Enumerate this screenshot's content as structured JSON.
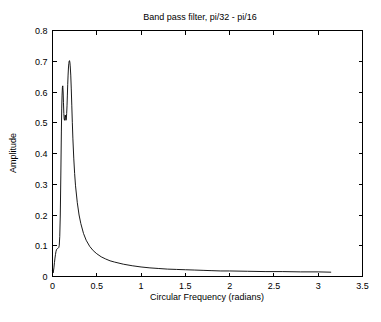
{
  "chart_data": {
    "type": "line",
    "title": "Band pass filter, pi/32 - pi/16",
    "xlabel": "Circular Frequency  (radians)",
    "ylabel": "Amplitude",
    "xlim": [
      0,
      3.5
    ],
    "ylim": [
      0,
      0.8
    ],
    "grid": false,
    "legend": null,
    "xticks": [
      "0",
      "0.5",
      "1",
      "1.5",
      "2",
      "2.5",
      "3",
      "3.5"
    ],
    "xtick_values": [
      0,
      0.5,
      1,
      1.5,
      2,
      2.5,
      3,
      3.5
    ],
    "yticks": [
      "0",
      "0.1",
      "0.2",
      "0.3",
      "0.4",
      "0.5",
      "0.6",
      "0.7",
      "0.8"
    ],
    "ytick_values": [
      0,
      0.1,
      0.2,
      0.3,
      0.4,
      0.5,
      0.6,
      0.7,
      0.8
    ],
    "series": [
      {
        "name": "Band pass filter magnitude response",
        "x": [
          0.0,
          0.008,
          0.016,
          0.022,
          0.028,
          0.034,
          0.04,
          0.046,
          0.052,
          0.058,
          0.064,
          0.07,
          0.076,
          0.082,
          0.088,
          0.094,
          0.1,
          0.104,
          0.108,
          0.112,
          0.116,
          0.12,
          0.124,
          0.128,
          0.132,
          0.136,
          0.14,
          0.144,
          0.148,
          0.152,
          0.156,
          0.16,
          0.164,
          0.168,
          0.172,
          0.176,
          0.18,
          0.184,
          0.188,
          0.192,
          0.196,
          0.2,
          0.206,
          0.212,
          0.218,
          0.224,
          0.23,
          0.24,
          0.25,
          0.26,
          0.28,
          0.3,
          0.32,
          0.35,
          0.38,
          0.42,
          0.46,
          0.5,
          0.55,
          0.6,
          0.65,
          0.7,
          0.8,
          0.9,
          1.0,
          1.1,
          1.2,
          1.3,
          1.4,
          1.5,
          1.6,
          1.7,
          1.8,
          1.9,
          2.0,
          2.2,
          2.4,
          2.6,
          2.8,
          3.0,
          3.1416
        ],
        "y": [
          0.018,
          0.012,
          0.028,
          0.045,
          0.06,
          0.072,
          0.082,
          0.088,
          0.09,
          0.091,
          0.092,
          0.094,
          0.1,
          0.13,
          0.2,
          0.33,
          0.47,
          0.545,
          0.59,
          0.615,
          0.62,
          0.6,
          0.565,
          0.53,
          0.512,
          0.508,
          0.515,
          0.525,
          0.518,
          0.508,
          0.512,
          0.53,
          0.555,
          0.59,
          0.625,
          0.655,
          0.678,
          0.692,
          0.7,
          0.702,
          0.697,
          0.685,
          0.655,
          0.61,
          0.555,
          0.5,
          0.45,
          0.385,
          0.335,
          0.295,
          0.24,
          0.2,
          0.172,
          0.14,
          0.118,
          0.098,
          0.084,
          0.074,
          0.064,
          0.057,
          0.051,
          0.047,
          0.04,
          0.035,
          0.031,
          0.028,
          0.026,
          0.024,
          0.023,
          0.022,
          0.021,
          0.02,
          0.019,
          0.018,
          0.018,
          0.017,
          0.016,
          0.016,
          0.015,
          0.015,
          0.014
        ]
      }
    ],
    "annotations": {
      "peak_1": {
        "x": 0.116,
        "y": 0.62
      },
      "valley": {
        "x": 0.136,
        "y": 0.508
      },
      "peak_2": {
        "x": 0.192,
        "y": 0.702
      },
      "curve_end": {
        "x": 3.1416,
        "y": 0.014
      }
    },
    "colors": {
      "curve": "#000000",
      "axis": "#000000",
      "background": "#ffffff",
      "text": "#000000"
    }
  }
}
